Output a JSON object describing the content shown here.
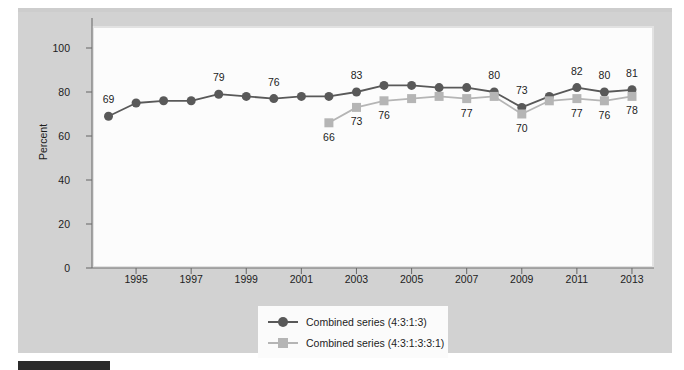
{
  "chart_data": {
    "type": "line",
    "title": "",
    "xlabel": "",
    "ylabel": "Percent",
    "ylim": [
      0,
      110
    ],
    "xlim": [
      1993.4,
      2013.8
    ],
    "grid": false,
    "legend_position": "bottom-center",
    "y_ticks": [
      0,
      20,
      40,
      60,
      80,
      100
    ],
    "y_tick_labels": [
      "0",
      "20",
      "40",
      "60",
      "80",
      "100"
    ],
    "x_ticks": [
      1995,
      1997,
      1999,
      2001,
      2003,
      2005,
      2007,
      2009,
      2011,
      2013
    ],
    "x_tick_labels": [
      "1995",
      "1997",
      "1999",
      "2001",
      "2003",
      "2005",
      "2007",
      "2009",
      "2011",
      "2013"
    ],
    "series": [
      {
        "name": "Combined series (4:3:1:3)",
        "marker": "circle",
        "color": "#595959",
        "x": [
          1994,
          1995,
          1996,
          1997,
          1998,
          1999,
          2000,
          2001,
          2002,
          2003,
          2004,
          2005,
          2006,
          2007,
          2008,
          2009,
          2010,
          2011,
          2012,
          2013
        ],
        "values": [
          69,
          75,
          76,
          76,
          79,
          78,
          77,
          78,
          78,
          80,
          83,
          83,
          82,
          82,
          80,
          73,
          78,
          82,
          80,
          81
        ],
        "labeled_points": [
          {
            "x": 1994,
            "value": 69,
            "label": "69",
            "position": "above"
          },
          {
            "x": 1998,
            "value": 79,
            "label": "79",
            "position": "above"
          },
          {
            "x": 2000,
            "value": 79,
            "label": "76",
            "position": "above"
          },
          {
            "x": 2003,
            "value": 80,
            "label": "83",
            "position": "above"
          },
          {
            "x": 2008,
            "value": 80,
            "label": "80",
            "position": "above"
          },
          {
            "x": 2009,
            "value": 73,
            "label": "73",
            "position": "above"
          },
          {
            "x": 2011,
            "value": 82,
            "label": "82",
            "position": "above"
          },
          {
            "x": 2012,
            "value": 80,
            "label": "80",
            "position": "above"
          },
          {
            "x": 2013,
            "value": 81,
            "label": "81",
            "position": "above"
          }
        ]
      },
      {
        "name": "Combined series (4:3:1:3:3:1)",
        "marker": "square",
        "color": "#b5b5b5",
        "x": [
          2002,
          2003,
          2004,
          2005,
          2006,
          2007,
          2008,
          2009,
          2010,
          2011,
          2012,
          2013
        ],
        "values": [
          66,
          73,
          76,
          77,
          78,
          77,
          78,
          70,
          76,
          77,
          76,
          78
        ],
        "labeled_points": [
          {
            "x": 2002,
            "value": 66,
            "label": "66",
            "position": "below"
          },
          {
            "x": 2003,
            "value": 73,
            "label": "73",
            "position": "below"
          },
          {
            "x": 2004,
            "value": 76,
            "label": "76",
            "position": "below"
          },
          {
            "x": 2007,
            "value": 77,
            "label": "77",
            "position": "below"
          },
          {
            "x": 2009,
            "value": 70,
            "label": "70",
            "position": "below"
          },
          {
            "x": 2011,
            "value": 77,
            "label": "77",
            "position": "below"
          },
          {
            "x": 2012,
            "value": 76,
            "label": "76",
            "position": "below"
          },
          {
            "x": 2013,
            "value": 78,
            "label": "78",
            "position": "below"
          }
        ]
      }
    ]
  },
  "legend": {
    "items": [
      {
        "label": "Combined series (4:3:1:3)"
      },
      {
        "label": "Combined series (4:3:1:3:3:1)"
      }
    ]
  },
  "colors": {
    "series_1": "#595959",
    "series_2": "#b5b5b5",
    "panel_background": "#d2d2d2",
    "plot_background": "#fcfcfc",
    "axis": "#6e6e6e",
    "text": "#1d1d1d"
  }
}
